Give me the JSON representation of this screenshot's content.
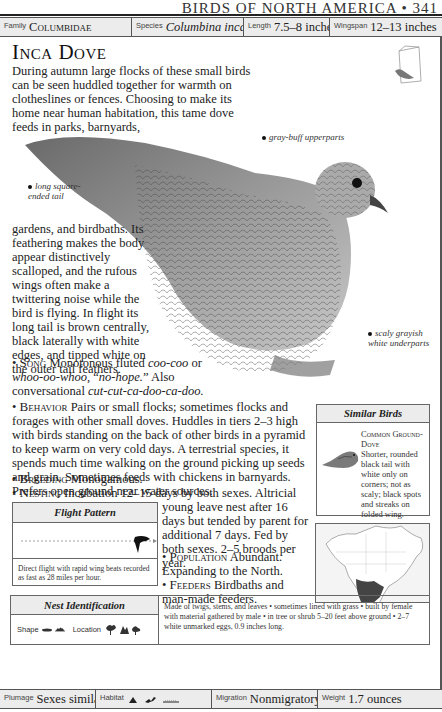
{
  "running_head": "BIRDS OF NORTH AMERICA • 341",
  "top_bar": {
    "family_label": "Family",
    "family_value": "Columbidae",
    "species_label": "Species",
    "species_value": "Columbina inca",
    "length_label": "Length",
    "length_value": "7.5–8 inches",
    "wingspan_label": "Wingspan",
    "wingspan_value": "12–13 inches"
  },
  "title": "Inca Dove",
  "intro": "During autumn large flocks of these small birds can be seen huddled together for warmth on clotheslines or fences. Choosing to make its home near human habitation, this tame dove feeds in parks, barnyards,",
  "body_continuation": "gardens, and birdbaths. Its feathering makes the body appear distinctively scalloped, and the rufous wings often make a twittering noise while the bird is flying. In flight its long tail is brown centrally, black laterally with white edges, and tipped white on the outer tail feathers.",
  "callouts": {
    "tail": "long square-ended tail",
    "upperparts": "gray-buff upperparts",
    "underparts": "scaly grayish white underparts"
  },
  "sections": {
    "song_key": "Song",
    "song_text_1": " Monotonous fluted ",
    "song_ital_1": "coo-coo",
    "song_text_2": " or ",
    "song_ital_2": "whoo-oo-whoo",
    "song_text_3": ", “",
    "song_ital_3": "no-hope.",
    "song_text_4": "” Also conversational ",
    "song_ital_4": "cut-cut-ca-doo-ca-doo.",
    "behavior_key": "Behavior",
    "behavior_text": " Pairs or small flocks; sometimes flocks and forages with other small doves. Huddles in tiers 2–3 high with birds standing on the back of other birds in a pyramid to keep warm on very cold days. A terrestrial species, it spends much time walking on the ground picking up seeds and grain. Sometimes feeds with chickens in barnyards. Prefers open ground near water sources.",
    "breeding_key": "Breeding",
    "breeding_text": " Monogamous.",
    "nesting_key": "Nesting",
    "nesting_text_a": " Incubation 12–15 days by both sexes. Altricial",
    "nesting_text_b": "young leave nest after 16 days but tended by parent for additional 7 days. Fed by both sexes. 2–5 broods per year.",
    "population_key": "Population",
    "population_text": " Abundant. Expanding to the North.",
    "feeders_key": "Feeders",
    "feeders_text": " Birdbaths and man-made feeders."
  },
  "similar_birds": {
    "header": "Similar Birds",
    "name": "Common Ground-Dove",
    "description": "Shorter, rounded black tail with white only on corners; not as scaly; black spots and streaks on folded wing."
  },
  "flight_pattern": {
    "header": "Flight Pattern",
    "caption": "Direct flight with rapid wing beats recorded as fast as 28 miles per hour."
  },
  "nest_identification": {
    "header": "Nest Identification",
    "shape_label": "Shape",
    "location_label": "Location",
    "description": "Made of twigs, stems, and leaves • sometimes lined with grass • built by female with material gathered by male • in tree or shrub 5–20 feet above ground • 2–7 white unmarked eggs, 0.9 inches long."
  },
  "bottom_bar": {
    "plumage_label": "Plumage",
    "plumage_value": "Sexes similar",
    "habitat_label": "Habitat",
    "migration_label": "Migration",
    "migration_value": "Nonmigratory",
    "weight_label": "Weight",
    "weight_value": "1.7 ounces"
  }
}
